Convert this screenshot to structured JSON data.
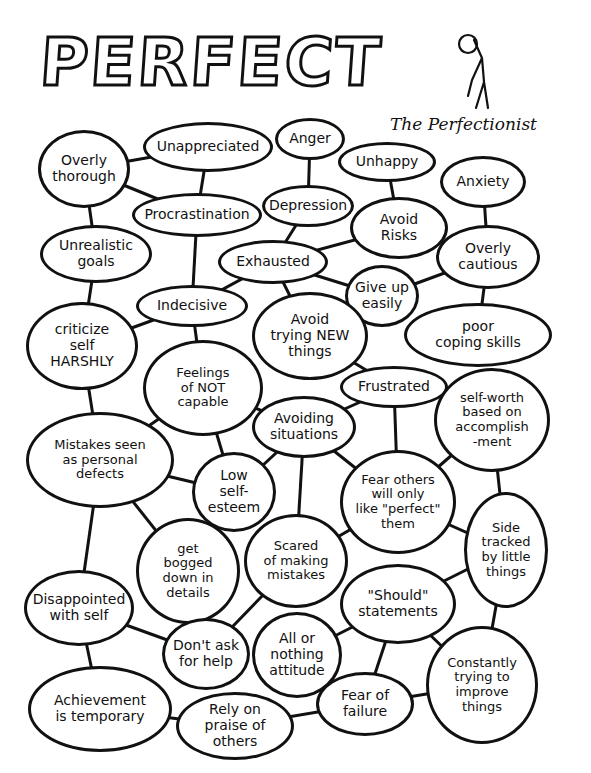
{
  "title": "PERFECT",
  "subtitle": "The Perfectionist",
  "figure_icon": "stick-figure-hunched-icon",
  "nodes": [
    {
      "id": "overly-thorough",
      "label": "Overly\nthorough",
      "x": 38,
      "y": 130,
      "w": 92,
      "h": 78
    },
    {
      "id": "unappreciated",
      "label": "Unappreciated",
      "x": 143,
      "y": 122,
      "w": 130,
      "h": 50
    },
    {
      "id": "anger",
      "label": "Anger",
      "x": 275,
      "y": 118,
      "w": 70,
      "h": 42
    },
    {
      "id": "unhappy",
      "label": "Unhappy",
      "x": 338,
      "y": 142,
      "w": 98,
      "h": 40
    },
    {
      "id": "anxiety",
      "label": "Anxiety",
      "x": 440,
      "y": 156,
      "w": 86,
      "h": 52
    },
    {
      "id": "procrastination",
      "label": "Procrastination",
      "x": 132,
      "y": 193,
      "w": 130,
      "h": 44
    },
    {
      "id": "depression",
      "label": "Depression",
      "x": 262,
      "y": 185,
      "w": 92,
      "h": 42
    },
    {
      "id": "avoid-risks",
      "label": "Avoid\nRisks",
      "x": 350,
      "y": 197,
      "w": 98,
      "h": 62
    },
    {
      "id": "unrealistic-goals",
      "label": "Unrealistic\ngoals",
      "x": 40,
      "y": 225,
      "w": 112,
      "h": 58
    },
    {
      "id": "exhausted",
      "label": "Exhausted",
      "x": 218,
      "y": 240,
      "w": 110,
      "h": 44
    },
    {
      "id": "overly-cautious",
      "label": "Overly\ncautious",
      "x": 436,
      "y": 225,
      "w": 104,
      "h": 64
    },
    {
      "id": "give-up-easily",
      "label": "Give up\neasily",
      "x": 345,
      "y": 265,
      "w": 74,
      "h": 62
    },
    {
      "id": "indecisive",
      "label": "Indecisive",
      "x": 136,
      "y": 285,
      "w": 112,
      "h": 42
    },
    {
      "id": "criticize-self-harshly",
      "label": "criticize\nself\nHARSHLY",
      "x": 26,
      "y": 302,
      "w": 112,
      "h": 88
    },
    {
      "id": "avoid-trying-new-things",
      "label": "Avoid\ntrying NEW\nthings",
      "x": 252,
      "y": 292,
      "w": 116,
      "h": 88
    },
    {
      "id": "poor-coping-skills",
      "label": "poor\ncoping skills",
      "x": 404,
      "y": 303,
      "w": 148,
      "h": 64
    },
    {
      "id": "feelings-of-not-capable",
      "label": "Feelings\nof NOT\ncapable",
      "x": 143,
      "y": 340,
      "w": 120,
      "h": 96
    },
    {
      "id": "frustrated",
      "label": "Frustrated",
      "x": 340,
      "y": 366,
      "w": 108,
      "h": 42
    },
    {
      "id": "self-worth",
      "label": "self-worth\nbased on\naccomplish\n-ment",
      "x": 434,
      "y": 368,
      "w": 116,
      "h": 104
    },
    {
      "id": "avoiding-situations",
      "label": "Avoiding\nsituations",
      "x": 252,
      "y": 396,
      "w": 104,
      "h": 62
    },
    {
      "id": "mistakes-seen",
      "label": "Mistakes seen\nas personal\ndefects",
      "x": 26,
      "y": 412,
      "w": 148,
      "h": 96
    },
    {
      "id": "low-self-esteem",
      "label": "Low\nself-\nesteem",
      "x": 192,
      "y": 452,
      "w": 84,
      "h": 80
    },
    {
      "id": "fear-others",
      "label": "Fear others\nwill only\nlike \"perfect\"\nthem",
      "x": 340,
      "y": 450,
      "w": 116,
      "h": 104
    },
    {
      "id": "side-tracked",
      "label": "Side\ntracked\nby little\nthings",
      "x": 464,
      "y": 492,
      "w": 84,
      "h": 116
    },
    {
      "id": "get-bogged-down",
      "label": "get\nbogged\ndown in\ndetails",
      "x": 136,
      "y": 518,
      "w": 104,
      "h": 106
    },
    {
      "id": "scared-of-making-mistakes",
      "label": "Scared\nof making\nmistakes",
      "x": 244,
      "y": 514,
      "w": 104,
      "h": 94
    },
    {
      "id": "should-statements",
      "label": "\"Should\"\nstatements",
      "x": 340,
      "y": 564,
      "w": 116,
      "h": 80
    },
    {
      "id": "disappointed-with-self",
      "label": "Disappointed\nwith self",
      "x": 24,
      "y": 570,
      "w": 110,
      "h": 76
    },
    {
      "id": "dont-ask-for-help",
      "label": "Don't ask\nfor help",
      "x": 162,
      "y": 618,
      "w": 88,
      "h": 72
    },
    {
      "id": "all-or-nothing",
      "label": "All or\nnothing\nattitude",
      "x": 252,
      "y": 612,
      "w": 90,
      "h": 86
    },
    {
      "id": "constantly-improve",
      "label": "Constantly\ntrying to\nimprove\nthings",
      "x": 426,
      "y": 626,
      "w": 112,
      "h": 118
    },
    {
      "id": "achievement-temporary",
      "label": "Achievement\nis temporary",
      "x": 28,
      "y": 666,
      "w": 144,
      "h": 86
    },
    {
      "id": "fear-of-failure",
      "label": "Fear of\nfailure",
      "x": 316,
      "y": 672,
      "w": 98,
      "h": 64
    },
    {
      "id": "rely-on-praise",
      "label": "Rely on\npraise of\nothers",
      "x": 176,
      "y": 692,
      "w": 118,
      "h": 68
    }
  ],
  "edges": [
    [
      "overly-thorough",
      "unappreciated"
    ],
    [
      "overly-thorough",
      "procrastination"
    ],
    [
      "overly-thorough",
      "unrealistic-goals"
    ],
    [
      "unappreciated",
      "procrastination"
    ],
    [
      "anger",
      "depression"
    ],
    [
      "unhappy",
      "avoid-risks"
    ],
    [
      "anxiety",
      "overly-cautious"
    ],
    [
      "procrastination",
      "indecisive"
    ],
    [
      "depression",
      "exhausted"
    ],
    [
      "avoid-risks",
      "exhausted"
    ],
    [
      "avoid-risks",
      "overly-cautious"
    ],
    [
      "overly-cautious",
      "give-up-easily"
    ],
    [
      "overly-cautious",
      "poor-coping-skills"
    ],
    [
      "exhausted",
      "give-up-easily"
    ],
    [
      "exhausted",
      "avoid-trying-new-things"
    ],
    [
      "exhausted",
      "indecisive"
    ],
    [
      "unrealistic-goals",
      "criticize-self-harshly"
    ],
    [
      "indecisive",
      "criticize-self-harshly"
    ],
    [
      "indecisive",
      "feelings-of-not-capable"
    ],
    [
      "criticize-self-harshly",
      "mistakes-seen"
    ],
    [
      "avoid-trying-new-things",
      "frustrated"
    ],
    [
      "feelings-of-not-capable",
      "avoiding-situations"
    ],
    [
      "feelings-of-not-capable",
      "mistakes-seen"
    ],
    [
      "feelings-of-not-capable",
      "low-self-esteem"
    ],
    [
      "frustrated",
      "avoiding-situations"
    ],
    [
      "frustrated",
      "fear-others"
    ],
    [
      "self-worth",
      "fear-others"
    ],
    [
      "self-worth",
      "side-tracked"
    ],
    [
      "avoiding-situations",
      "fear-others"
    ],
    [
      "avoiding-situations",
      "scared-of-making-mistakes"
    ],
    [
      "mistakes-seen",
      "low-self-esteem"
    ],
    [
      "mistakes-seen",
      "get-bogged-down"
    ],
    [
      "mistakes-seen",
      "disappointed-with-self"
    ],
    [
      "low-self-esteem",
      "avoiding-situations"
    ],
    [
      "fear-others",
      "scared-of-making-mistakes"
    ],
    [
      "fear-others",
      "side-tracked"
    ],
    [
      "side-tracked",
      "should-statements"
    ],
    [
      "side-tracked",
      "constantly-improve"
    ],
    [
      "scared-of-making-mistakes",
      "dont-ask-for-help"
    ],
    [
      "should-statements",
      "all-or-nothing"
    ],
    [
      "should-statements",
      "fear-of-failure"
    ],
    [
      "should-statements",
      "constantly-improve"
    ],
    [
      "disappointed-with-self",
      "dont-ask-for-help"
    ],
    [
      "disappointed-with-self",
      "achievement-temporary"
    ],
    [
      "achievement-temporary",
      "rely-on-praise"
    ],
    [
      "rely-on-praise",
      "fear-of-failure"
    ],
    [
      "all-or-nothing",
      "fear-of-failure"
    ],
    [
      "fear-of-failure",
      "constantly-improve"
    ]
  ],
  "colors": {
    "ink": "#111111",
    "paper": "#ffffff"
  }
}
